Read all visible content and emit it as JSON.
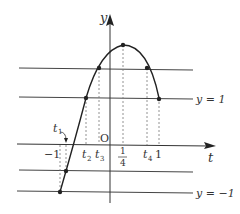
{
  "diagram": {
    "axes": {
      "x_label": "t",
      "y_label": "y",
      "origin_label": "O"
    },
    "horizontal_lines": [
      {
        "name": "line-upper",
        "label": ""
      },
      {
        "name": "line-y-equals-1",
        "label": "y = 1"
      },
      {
        "name": "line-lower",
        "label": ""
      },
      {
        "name": "line-y-equals-minus-1",
        "label": "y = −1"
      }
    ],
    "tick_labels": {
      "minus_one": "−1",
      "t1": "t",
      "t1_sub": "1",
      "t2": "t",
      "t2_sub": "2",
      "t3": "t",
      "t3_sub": "3",
      "quarter_num": "1",
      "quarter_den": "4",
      "t4": "t",
      "t4_sub": "4",
      "one": "1"
    },
    "colors": {
      "line": "#333333",
      "curve": "#222222",
      "dashed": "#666666"
    }
  }
}
